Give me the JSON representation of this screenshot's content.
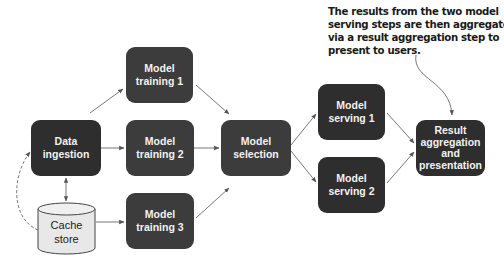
{
  "annotation": {
    "lines": [
      "The results from the two model",
      "serving steps are then aggregated",
      "via a result aggregation step to",
      "present to users."
    ]
  },
  "nodes": {
    "data_ingestion": {
      "lines": [
        "Data ingestion"
      ]
    },
    "model_training_1": {
      "lines": [
        "Model",
        "training 1"
      ]
    },
    "model_training_2": {
      "lines": [
        "Model",
        "training 2"
      ]
    },
    "model_training_3": {
      "lines": [
        "Model",
        "training 3"
      ]
    },
    "model_selection": {
      "lines": [
        "Model",
        "selection"
      ]
    },
    "model_serving_1": {
      "lines": [
        "Model",
        "serving 1"
      ]
    },
    "model_serving_2": {
      "lines": [
        "Model",
        "serving 2"
      ]
    },
    "result_aggregation": {
      "lines": [
        "Result",
        "aggregation",
        "and",
        "presentation"
      ]
    },
    "cache_store": {
      "lines": [
        "Cache",
        "store"
      ]
    }
  },
  "colors": {
    "node_fill": "#3c3c3c",
    "node_text": "#f2f2f2",
    "cylinder_fill": "#e8e8e8",
    "edge": "#555555"
  }
}
